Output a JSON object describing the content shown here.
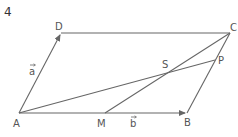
{
  "problem_number": "4",
  "figure": {
    "points": {
      "A": {
        "label": "A"
      },
      "B": {
        "label": "B"
      },
      "C": {
        "label": "C"
      },
      "D": {
        "label": "D"
      },
      "M": {
        "label": "M"
      },
      "S": {
        "label": "S"
      },
      "P": {
        "label": "P"
      }
    },
    "vectors": [
      {
        "name": "a",
        "label": "a",
        "from": "A",
        "to": "D"
      },
      {
        "name": "b",
        "label": "b",
        "from": "A",
        "to": "B"
      }
    ],
    "segments": [
      {
        "from": "D",
        "to": "C"
      },
      {
        "from": "C",
        "to": "B"
      },
      {
        "from": "A",
        "to": "P"
      },
      {
        "from": "M",
        "to": "C"
      }
    ]
  }
}
